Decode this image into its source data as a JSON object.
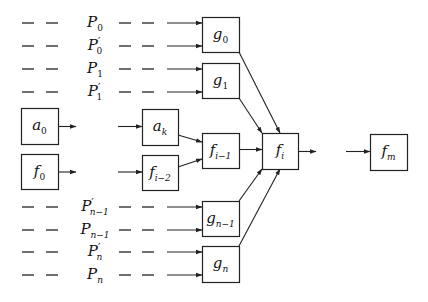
{
  "diagram": {
    "title": "",
    "boxes": [
      {
        "id": "g0",
        "label": "g",
        "sub": "0",
        "x": 202,
        "y": 17,
        "w": 37,
        "h": 35
      },
      {
        "id": "g1",
        "label": "g",
        "sub": "1",
        "x": 202,
        "y": 63,
        "w": 37,
        "h": 35
      },
      {
        "id": "a0",
        "label": "a",
        "sub": "0",
        "x": 21,
        "y": 108,
        "w": 37,
        "h": 36
      },
      {
        "id": "ak",
        "label": "a",
        "sub": "k",
        "x": 142,
        "y": 109,
        "w": 36,
        "h": 36
      },
      {
        "id": "fim1",
        "label": "f",
        "sub": "i−1",
        "x": 202,
        "y": 133,
        "w": 37,
        "h": 35
      },
      {
        "id": "fi",
        "label": "f",
        "sub": "i",
        "x": 262,
        "y": 133,
        "w": 36,
        "h": 36
      },
      {
        "id": "fm",
        "label": "f",
        "sub": "m",
        "x": 370,
        "y": 134,
        "w": 37,
        "h": 36
      },
      {
        "id": "f0",
        "label": "f",
        "sub": "0",
        "x": 21,
        "y": 154,
        "w": 37,
        "h": 35
      },
      {
        "id": "fim2",
        "label": "f",
        "sub": "i−2",
        "x": 142,
        "y": 155,
        "w": 36,
        "h": 35
      },
      {
        "id": "gnm1",
        "label": "g",
        "sub": "n−1",
        "x": 202,
        "y": 201,
        "w": 37,
        "h": 35
      },
      {
        "id": "gn",
        "label": "g",
        "sub": "n",
        "x": 202,
        "y": 246,
        "w": 37,
        "h": 36
      }
    ],
    "input_rows": [
      {
        "label": "P",
        "sub": "0",
        "prime": false,
        "y": 23,
        "target": "g0"
      },
      {
        "label": "P",
        "sub": "0",
        "prime": true,
        "y": 46,
        "target": "g0"
      },
      {
        "label": "P",
        "sub": "1",
        "prime": false,
        "y": 69,
        "target": "g1"
      },
      {
        "label": "P",
        "sub": "1",
        "prime": true,
        "y": 92,
        "target": "g1"
      },
      {
        "label": "P",
        "sub": "n−1",
        "prime": true,
        "y": 207,
        "target": "gnm1"
      },
      {
        "label": "P",
        "sub": "n−1",
        "prime": false,
        "y": 230,
        "target": "gnm1"
      },
      {
        "label": "P",
        "sub": "n",
        "prime": true,
        "y": 252,
        "target": "gn"
      },
      {
        "label": "P",
        "sub": "n",
        "prime": false,
        "y": 275,
        "target": "gn"
      }
    ],
    "edges": [
      {
        "from": "a0",
        "to": "ak",
        "style": "elided"
      },
      {
        "from": "f0",
        "to": "fim2",
        "style": "elided"
      },
      {
        "from": "ak",
        "to": "fim1"
      },
      {
        "from": "fim2",
        "to": "fim1"
      },
      {
        "from": "fim1",
        "to": "fi"
      },
      {
        "from": "g0",
        "to": "fi"
      },
      {
        "from": "g1",
        "to": "fi"
      },
      {
        "from": "gnm1",
        "to": "fi"
      },
      {
        "from": "gn",
        "to": "fi"
      },
      {
        "from": "fi",
        "to": "fm",
        "style": "elided"
      }
    ],
    "colors": {
      "stroke": "#222222",
      "background": "#ffffff",
      "text": "#111111"
    }
  }
}
